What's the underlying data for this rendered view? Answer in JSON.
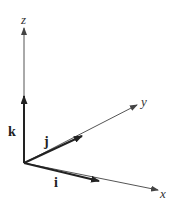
{
  "diagram": {
    "type": "3d-coordinate-axes-with-unit-vectors",
    "axes": [
      {
        "name": "z",
        "label": "z"
      },
      {
        "name": "y",
        "label": "y"
      },
      {
        "name": "x",
        "label": "x"
      }
    ],
    "vectors": [
      {
        "name": "k",
        "label": "k",
        "along": "z"
      },
      {
        "name": "j",
        "label": "j",
        "along": "y"
      },
      {
        "name": "i",
        "label": "i",
        "along": "x"
      }
    ],
    "colors": {
      "axis": "#555555",
      "vector": "#222222",
      "background": "#ffffff"
    }
  }
}
